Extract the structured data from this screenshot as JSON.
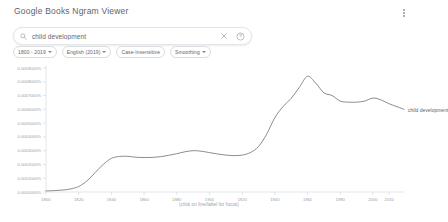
{
  "header": {
    "title": "Google Books Ngram Viewer",
    "menu_icon": "kebab-menu-icon"
  },
  "search": {
    "value": "child development",
    "placeholder": "",
    "search_icon": "search-icon",
    "clear_icon": "close-icon",
    "help_icon": "help-circle-icon"
  },
  "chips": [
    {
      "label": "1800 - 2019",
      "caret": true
    },
    {
      "label": "English (2019)",
      "caret": true
    },
    {
      "label": "Case-Insensitive",
      "caret": false
    },
    {
      "label": "Smoothing",
      "caret": true
    }
  ],
  "chart_footer": "(click on line/label for focus)",
  "colors": {
    "line": "#6c6f74",
    "axis": "#d0d3d6",
    "text": "#5f6368"
  },
  "chart_data": {
    "type": "line",
    "title": "",
    "xlabel": "",
    "ylabel": "",
    "xlim": [
      1800,
      2019
    ],
    "ylim": [
      0.0,
      0.0009
    ],
    "grid": false,
    "legend_position": "right-of-line",
    "annotation": "(click on line/label for focus)",
    "ytick_labels": [
      "0.0009000%",
      "0.0008000%",
      "0.0007000%",
      "0.0006000%",
      "0.0005000%",
      "0.0004000%",
      "0.0003000%",
      "0.0002000%",
      "0.0001000%",
      "0.0000000%"
    ],
    "ytick_values": [
      0.0009,
      0.0008,
      0.0007,
      0.0006,
      0.0005,
      0.0004,
      0.0003,
      0.0002,
      0.0001,
      0.0
    ],
    "xtick_labels": [
      "1800",
      "1820",
      "1840",
      "1860",
      "1880",
      "1900",
      "1920",
      "1940",
      "1960",
      "1980",
      "2000",
      "2010"
    ],
    "xtick_values": [
      1800,
      1820,
      1840,
      1860,
      1880,
      1900,
      1920,
      1940,
      1960,
      1980,
      2000,
      2010
    ],
    "series": [
      {
        "name": "child development",
        "color": "#6c6f74",
        "x": [
          1800,
          1805,
          1810,
          1815,
          1820,
          1825,
          1830,
          1835,
          1840,
          1845,
          1850,
          1855,
          1860,
          1865,
          1870,
          1875,
          1880,
          1885,
          1890,
          1895,
          1900,
          1905,
          1910,
          1915,
          1920,
          1925,
          1930,
          1935,
          1940,
          1945,
          1950,
          1955,
          1960,
          1965,
          1970,
          1975,
          1980,
          1985,
          1990,
          1995,
          2000,
          2005,
          2010,
          2015,
          2019
        ],
        "y": [
          8e-06,
          1e-05,
          1.4e-05,
          2.2e-05,
          4e-05,
          8e-05,
          0.00014,
          0.0002,
          0.000244,
          0.000258,
          0.000259,
          0.000252,
          0.00025,
          0.000251,
          0.000256,
          0.000266,
          0.000278,
          0.000292,
          0.0003,
          0.000296,
          0.000286,
          0.000276,
          0.000268,
          0.000264,
          0.000268,
          0.000286,
          0.00033,
          0.00042,
          0.00054,
          0.00062,
          0.00068,
          0.00076,
          0.00084,
          0.00079,
          0.00072,
          0.0007,
          0.00066,
          0.000652,
          0.000652,
          0.00066,
          0.000682,
          0.000668,
          0.00064,
          0.000618,
          0.0006
        ]
      }
    ]
  }
}
